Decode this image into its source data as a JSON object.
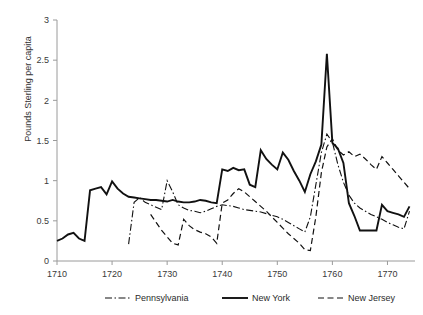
{
  "chart_data": {
    "type": "line",
    "title": "",
    "xlabel": "",
    "ylabel": "Pounds Sterling per capita",
    "xlim": [
      1710,
      1775
    ],
    "ylim": [
      0,
      3
    ],
    "xticks": [
      1710,
      1720,
      1730,
      1740,
      1750,
      1760,
      1770
    ],
    "yticks": [
      0,
      0.5,
      1,
      1.5,
      2,
      2.5,
      3
    ],
    "xtick_labels": [
      "1710",
      "1720",
      "1730",
      "1740",
      "1750",
      "1760",
      "1770"
    ],
    "ytick_labels": [
      "0",
      "0.5",
      "1",
      "1.5",
      "2",
      "2.5",
      "3"
    ],
    "grid": false,
    "legend_position": "bottom",
    "series": [
      {
        "name": "Pennsylvania",
        "style": "dash-dot",
        "color": "#111111",
        "x": [
          1723,
          1724,
          1725,
          1726,
          1727,
          1728,
          1729,
          1730,
          1731,
          1732,
          1733,
          1734,
          1735,
          1736,
          1737,
          1738,
          1739,
          1740,
          1741,
          1742,
          1743,
          1744,
          1745,
          1746,
          1747,
          1748,
          1749,
          1750,
          1751,
          1752,
          1753,
          1754,
          1755,
          1756,
          1757,
          1758,
          1759,
          1760,
          1761,
          1762,
          1763,
          1764,
          1765,
          1766,
          1767,
          1768,
          1769,
          1770,
          1771,
          1772,
          1773,
          1774
        ],
        "values": [
          0.21,
          0.73,
          0.79,
          0.73,
          0.7,
          0.67,
          0.64,
          1.0,
          0.86,
          0.7,
          0.66,
          0.63,
          0.62,
          0.6,
          0.62,
          0.65,
          0.68,
          0.7,
          0.69,
          0.68,
          0.66,
          0.64,
          0.63,
          0.62,
          0.61,
          0.59,
          0.57,
          0.55,
          0.52,
          0.48,
          0.44,
          0.4,
          0.36,
          0.55,
          0.95,
          1.35,
          1.58,
          1.48,
          1.2,
          0.98,
          0.82,
          0.72,
          0.66,
          0.62,
          0.58,
          0.55,
          0.52,
          0.48,
          0.45,
          0.42,
          0.4,
          0.62
        ]
      },
      {
        "name": "New York",
        "style": "solid",
        "color": "#111111",
        "x": [
          1710,
          1711,
          1712,
          1713,
          1714,
          1715,
          1716,
          1717,
          1718,
          1719,
          1720,
          1721,
          1722,
          1723,
          1724,
          1725,
          1726,
          1727,
          1728,
          1729,
          1730,
          1731,
          1732,
          1733,
          1734,
          1735,
          1736,
          1737,
          1738,
          1739,
          1740,
          1741,
          1742,
          1743,
          1744,
          1745,
          1746,
          1747,
          1748,
          1749,
          1750,
          1751,
          1752,
          1753,
          1754,
          1755,
          1756,
          1757,
          1758,
          1759,
          1760,
          1761,
          1762,
          1763,
          1764,
          1765,
          1766,
          1767,
          1768,
          1769,
          1770,
          1771,
          1772,
          1773,
          1774
        ],
        "values": [
          0.25,
          0.28,
          0.33,
          0.35,
          0.28,
          0.25,
          0.88,
          0.9,
          0.92,
          0.83,
          0.99,
          0.9,
          0.84,
          0.8,
          0.79,
          0.78,
          0.77,
          0.76,
          0.76,
          0.75,
          0.74,
          0.76,
          0.74,
          0.73,
          0.73,
          0.74,
          0.76,
          0.75,
          0.73,
          0.72,
          1.14,
          1.12,
          1.16,
          1.13,
          1.14,
          0.95,
          0.92,
          1.38,
          1.27,
          1.2,
          1.14,
          1.35,
          1.26,
          1.12,
          1.0,
          0.86,
          1.08,
          1.24,
          1.45,
          2.58,
          1.47,
          1.4,
          1.22,
          0.72,
          0.56,
          0.38,
          0.38,
          0.38,
          0.38,
          0.7,
          0.62,
          0.6,
          0.58,
          0.55,
          0.68
        ]
      },
      {
        "name": "New Jersey",
        "style": "dashed",
        "color": "#111111",
        "x": [
          1727,
          1728,
          1729,
          1730,
          1731,
          1732,
          1733,
          1734,
          1735,
          1736,
          1737,
          1738,
          1739,
          1740,
          1741,
          1742,
          1743,
          1744,
          1745,
          1746,
          1747,
          1748,
          1749,
          1750,
          1751,
          1752,
          1753,
          1754,
          1755,
          1756,
          1757,
          1758,
          1759,
          1760,
          1761,
          1762,
          1763,
          1764,
          1765,
          1766,
          1767,
          1768,
          1769,
          1770,
          1771,
          1772,
          1773,
          1774
        ],
        "values": [
          0.58,
          0.48,
          0.38,
          0.3,
          0.22,
          0.2,
          0.52,
          0.44,
          0.39,
          0.36,
          0.34,
          0.3,
          0.22,
          0.72,
          0.76,
          0.84,
          0.9,
          0.86,
          0.8,
          0.74,
          0.68,
          0.62,
          0.55,
          0.48,
          0.41,
          0.34,
          0.28,
          0.22,
          0.14,
          0.13,
          0.55,
          1.1,
          1.42,
          1.52,
          1.38,
          1.32,
          1.36,
          1.3,
          1.33,
          1.27,
          1.2,
          1.14,
          1.3,
          1.22,
          1.14,
          1.06,
          0.98,
          0.9
        ]
      }
    ]
  },
  "legend": {
    "items": [
      {
        "label": "Pennsylvania",
        "style": "dash-dot"
      },
      {
        "label": "New York",
        "style": "solid"
      },
      {
        "label": "New Jersey",
        "style": "dashed"
      }
    ]
  }
}
